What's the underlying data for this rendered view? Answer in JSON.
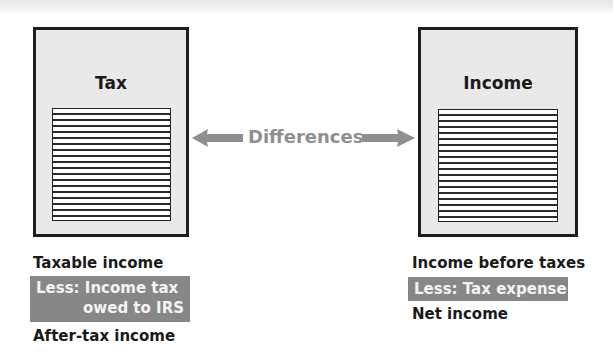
{
  "diagram": {
    "left_document": {
      "title_line1": "Tax",
      "title_line2": "Return",
      "rule_lines": 18
    },
    "connector": {
      "label": "Differences",
      "arrow_left": "left-arrow",
      "arrow_right": "right-arrow",
      "color": "#8f8f8f"
    },
    "right_document": {
      "title_line1": "Income",
      "title_line2": "Statement",
      "rule_lines": 18
    },
    "left_calc": {
      "line1": "Taxable income",
      "highlight_line1": "Less: Income tax",
      "highlight_line2": "owed to IRS",
      "line3": "After-tax income"
    },
    "right_calc": {
      "line1": "Income before taxes",
      "highlight_line1": "Less: Tax expense",
      "line3": "Net income"
    },
    "colors": {
      "document_fill": "#e9e9e9",
      "document_border": "#1e1e1e",
      "highlight_fill": "#878787",
      "highlight_text": "#f4f4f4"
    }
  }
}
